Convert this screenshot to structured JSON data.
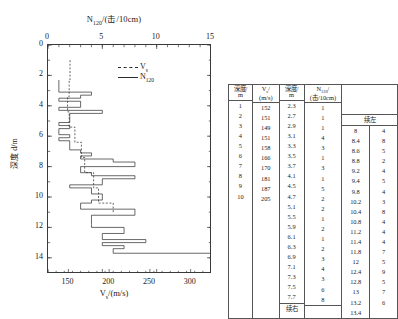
{
  "chart_data": {
    "type": "line",
    "title": "",
    "top_axis": {
      "label": "N120/(击/10cm)",
      "label_main": "N",
      "label_sub": "120",
      "label_rest": "/(击/10cm)",
      "ticks": [
        0,
        5,
        10,
        15
      ],
      "range": [
        0,
        15
      ]
    },
    "bottom_axis": {
      "label": "Vs/(m/s)",
      "label_main": "V",
      "label_sub": "s",
      "label_rest": "/(m/s)",
      "ticks": [
        150,
        200,
        250,
        300
      ],
      "range": [
        125,
        325
      ]
    },
    "y_axis": {
      "label": "深度 d/m",
      "ticks": [
        0,
        2,
        4,
        6,
        8,
        10,
        12,
        14
      ],
      "range": [
        0,
        15
      ],
      "minor_step": 1
    },
    "legend": [
      {
        "name": "Vs",
        "label_main": "V",
        "label_sub": "s",
        "style": "dashed"
      },
      {
        "name": "N120",
        "label_main": "N",
        "label_sub": "120",
        "style": "solid"
      }
    ],
    "series": [
      {
        "name": "Vs",
        "style": "dashed",
        "axis": "bottom",
        "points": [
          [
            152,
            1.0
          ],
          [
            152,
            2.3
          ],
          [
            151,
            2.3
          ],
          [
            151,
            3.4
          ],
          [
            149,
            3.4
          ],
          [
            149,
            4.4
          ],
          [
            151,
            4.4
          ],
          [
            151,
            5.4
          ],
          [
            158,
            5.4
          ],
          [
            158,
            6.4
          ],
          [
            166,
            6.4
          ],
          [
            166,
            7.4
          ],
          [
            170,
            7.4
          ],
          [
            170,
            8.4
          ],
          [
            181,
            8.4
          ],
          [
            181,
            9.4
          ],
          [
            187,
            9.4
          ],
          [
            187,
            10.4
          ],
          [
            205,
            10.4
          ],
          [
            205,
            11.0
          ]
        ]
      },
      {
        "name": "N120",
        "style": "solid",
        "axis": "top",
        "points": [
          [
            1,
            2.3
          ],
          [
            1,
            2.7
          ],
          [
            1,
            2.9
          ],
          [
            1,
            3.1
          ],
          [
            4,
            3.1
          ],
          [
            4,
            3.3
          ],
          [
            3,
            3.3
          ],
          [
            3,
            3.5
          ],
          [
            1,
            3.5
          ],
          [
            1,
            3.7
          ],
          [
            3,
            3.7
          ],
          [
            3,
            4.1
          ],
          [
            1,
            4.1
          ],
          [
            1,
            4.3
          ],
          [
            5,
            4.3
          ],
          [
            5,
            4.5
          ],
          [
            2,
            4.5
          ],
          [
            2,
            4.7
          ],
          [
            2,
            4.7
          ],
          [
            2,
            5.1
          ],
          [
            1,
            5.1
          ],
          [
            1,
            5.3
          ],
          [
            2,
            5.3
          ],
          [
            2,
            5.5
          ],
          [
            1,
            5.5
          ],
          [
            1,
            5.9
          ],
          [
            2,
            5.9
          ],
          [
            2,
            6.1
          ],
          [
            1,
            6.1
          ],
          [
            1,
            6.3
          ],
          [
            2,
            6.3
          ],
          [
            2,
            6.9
          ],
          [
            3,
            6.9
          ],
          [
            3,
            7.1
          ],
          [
            4,
            7.1
          ],
          [
            4,
            7.3
          ],
          [
            3,
            7.3
          ],
          [
            3,
            7.5
          ],
          [
            6,
            7.5
          ],
          [
            6,
            7.7
          ],
          [
            8,
            7.7
          ],
          [
            8,
            8.0
          ],
          [
            3,
            8.0
          ],
          [
            3,
            8.4
          ],
          [
            4,
            8.4
          ],
          [
            4,
            8.6
          ],
          [
            8,
            8.6
          ],
          [
            8,
            8.8
          ],
          [
            5,
            8.8
          ],
          [
            5,
            9.2
          ],
          [
            2,
            9.2
          ],
          [
            2,
            9.4
          ],
          [
            4,
            9.4
          ],
          [
            4,
            9.8
          ],
          [
            5,
            9.8
          ],
          [
            5,
            10.2
          ],
          [
            4,
            10.2
          ],
          [
            4,
            10.4
          ],
          [
            3,
            10.4
          ],
          [
            3,
            10.8
          ],
          [
            8,
            10.8
          ],
          [
            8,
            11.2
          ],
          [
            4,
            11.2
          ],
          [
            4,
            11.4
          ],
          [
            4,
            11.4
          ],
          [
            4,
            11.8
          ],
          [
            4,
            11.8
          ],
          [
            4,
            12.0
          ],
          [
            7,
            12.0
          ],
          [
            7,
            12.4
          ],
          [
            5,
            12.4
          ],
          [
            5,
            12.8
          ],
          [
            9,
            12.8
          ],
          [
            9,
            13.0
          ],
          [
            5,
            13.0
          ],
          [
            5,
            13.2
          ],
          [
            7,
            13.2
          ],
          [
            7,
            13.4
          ],
          [
            6,
            13.4
          ],
          [
            6,
            13.7
          ],
          [
            15,
            13.7
          ]
        ]
      }
    ]
  },
  "table": {
    "headers": {
      "depth_left": "深度/ m",
      "depth_left_line1": "深度/",
      "depth_left_line2": "m",
      "vs": "Vs/ (m/s)",
      "vs_line1": "Vs/",
      "vs_line2": "(m/s)",
      "depth_mid_line1": "深度/",
      "depth_mid_line2": "m",
      "n120_line1": "N120/",
      "n120_line2": "(击/10cm)"
    },
    "continued_left_label": "续左",
    "continued_right_label": "续右",
    "left_block": {
      "depth": [
        "1",
        "2",
        "3",
        "4",
        "5",
        "6",
        "7",
        "8",
        "9",
        "10"
      ],
      "vs": [
        "152",
        "151",
        "149",
        "151",
        "158",
        "166",
        "170",
        "181",
        "187",
        "205"
      ]
    },
    "middle_block": {
      "depth": [
        "2.3",
        "2.7",
        "2.9",
        "3.1",
        "3.3",
        "3.5",
        "3.7",
        "4.1",
        "4.5",
        "4.7",
        "5.1",
        "5.5",
        "5.9",
        "6.1",
        "6.3",
        "6.9",
        "7.1",
        "7.3",
        "7.5",
        "7.7"
      ],
      "n120": [
        "1",
        "1",
        "1",
        "4",
        "3",
        "1",
        "3",
        "1",
        "5",
        "2",
        "2",
        "1",
        "2",
        "1",
        "2",
        "3",
        "4",
        "3",
        "6",
        "8"
      ]
    },
    "right_block": {
      "depth": [
        "8",
        "8.4",
        "8.6",
        "8.8",
        "9.2",
        "9.4",
        "9.8",
        "10.2",
        "10.4",
        "10.8",
        "11.2",
        "11.4",
        "11.8",
        "12",
        "12.4",
        "12.8",
        "13",
        "13.2",
        "13.4"
      ],
      "n120": [
        "4",
        "8",
        "5",
        "2",
        "4",
        "5",
        "4",
        "3",
        "8",
        "4",
        "4",
        "4",
        "7",
        "5",
        "9",
        "5",
        "7",
        "6",
        ""
      ]
    }
  }
}
